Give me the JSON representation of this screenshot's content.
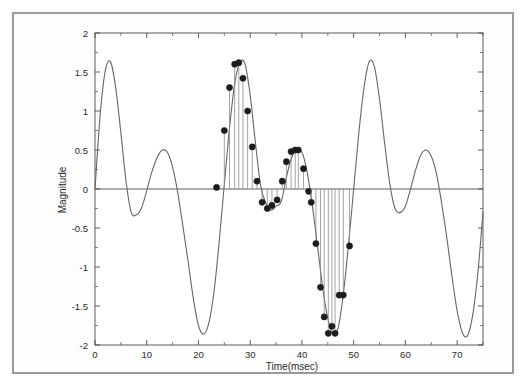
{
  "figure": {
    "name": "magnitude-vs-time-stem-plot",
    "background_color": "#ffffff",
    "frame_color": "#9a9a9a",
    "axis_color": "#4a4a4a",
    "curve_color": "#666666",
    "marker_color": "#1c1c1c",
    "stem_color": "#8c8c8c"
  },
  "chart_data": {
    "type": "line",
    "title": "",
    "subtitle": "",
    "xlabel": "Time(msec)",
    "ylabel": "Magnitude",
    "xlim": [
      0,
      75
    ],
    "ylim": [
      -2,
      2
    ],
    "xticks": [
      0,
      10,
      20,
      30,
      40,
      50,
      60,
      70
    ],
    "xticklabels": [
      "0",
      "10",
      "20",
      "30",
      "40",
      "50",
      "60",
      "70"
    ],
    "yticks": [
      -2,
      -1.5,
      -1,
      -0.5,
      0,
      0.5,
      1,
      1.5,
      2
    ],
    "yticklabels": [
      "-2",
      "-1.5",
      "-1",
      "-0.5",
      "0",
      "0.5",
      "1",
      "1.5",
      "2"
    ],
    "xminorticks": [
      5,
      15,
      25,
      35,
      45,
      55,
      65,
      75
    ],
    "yminorticks": [
      -1.75,
      -1.25,
      -0.75,
      -0.25,
      0.25,
      0.75,
      1.25,
      1.75
    ],
    "grid": false,
    "legend": null,
    "zero_line": 0,
    "series": [
      {
        "name": "continuous-waveform",
        "kind": "line",
        "style": "solid",
        "color": "#666666",
        "description": "Beat waveform: sum of two close-frequency sinusoids, period ~50 msec envelope",
        "x": [
          0,
          1,
          2,
          3,
          4,
          5,
          6,
          7,
          8,
          9,
          10,
          11,
          12,
          13,
          14,
          15,
          16,
          17,
          18,
          19,
          20,
          21,
          22,
          23,
          24,
          25,
          26,
          27,
          28,
          29,
          30,
          31,
          32,
          33,
          34,
          35,
          36,
          37,
          38,
          39,
          40,
          41,
          42,
          43,
          44,
          45,
          46,
          47,
          48,
          49,
          50,
          51,
          52,
          53,
          54,
          55,
          56,
          57,
          58,
          59,
          60,
          61,
          62,
          63,
          64,
          65,
          66,
          67,
          68,
          69,
          70,
          71,
          72,
          73,
          74,
          75
        ],
        "y": [
          0.0,
          0.95,
          1.52,
          1.63,
          1.3,
          0.72,
          0.1,
          -0.3,
          -0.33,
          -0.24,
          -0.02,
          0.22,
          0.4,
          0.5,
          0.47,
          0.28,
          -0.05,
          -0.48,
          -0.93,
          -1.4,
          -1.75,
          -1.86,
          -1.72,
          -1.32,
          -0.68,
          0.06,
          0.78,
          1.35,
          1.62,
          1.6,
          1.2,
          0.6,
          0.05,
          -0.18,
          -0.27,
          -0.22,
          -0.16,
          0.15,
          0.4,
          0.5,
          0.47,
          0.22,
          -0.21,
          -0.72,
          -1.26,
          -1.66,
          -1.86,
          -1.78,
          -1.35,
          -0.72,
          0.0,
          0.72,
          1.3,
          1.63,
          1.57,
          1.15,
          0.58,
          0.06,
          -0.25,
          -0.3,
          -0.22,
          0.0,
          0.25,
          0.44,
          0.5,
          0.42,
          0.2,
          -0.18,
          -0.62,
          -1.12,
          -1.56,
          -1.84,
          -1.88,
          -1.62,
          -1.08,
          -0.3
        ]
      },
      {
        "name": "sampled-stems-segment-1",
        "kind": "stem",
        "marker": "filled-circle",
        "color": "#1c1c1c",
        "stem_color": "#8c8c8c",
        "x": [
          23.5,
          25.0,
          26.0,
          27.0,
          27.8,
          28.6,
          29.5,
          30.4,
          31.3,
          32.3,
          33.3,
          34.2,
          35.2,
          36.2,
          37.0,
          37.9,
          38.7,
          39.3,
          40.3,
          41.3
        ],
        "y": [
          0.02,
          0.75,
          1.3,
          1.6,
          1.62,
          1.42,
          1.0,
          0.54,
          0.1,
          -0.17,
          -0.25,
          -0.21,
          -0.14,
          0.1,
          0.35,
          0.48,
          0.5,
          0.5,
          0.26,
          -0.03
        ]
      },
      {
        "name": "sampled-stems-segment-2",
        "kind": "stem",
        "marker": "filled-circle",
        "color": "#1c1c1c",
        "stem_color": "#8c8c8c",
        "x": [
          41.8,
          42.7,
          43.6,
          44.3,
          45.1,
          45.8,
          46.4,
          47.2,
          48.0,
          49.2
        ],
        "y": [
          -0.17,
          -0.7,
          -1.26,
          -1.64,
          -1.85,
          -1.76,
          -1.85,
          -1.36,
          -1.36,
          -0.73
        ]
      }
    ],
    "annotations": []
  }
}
